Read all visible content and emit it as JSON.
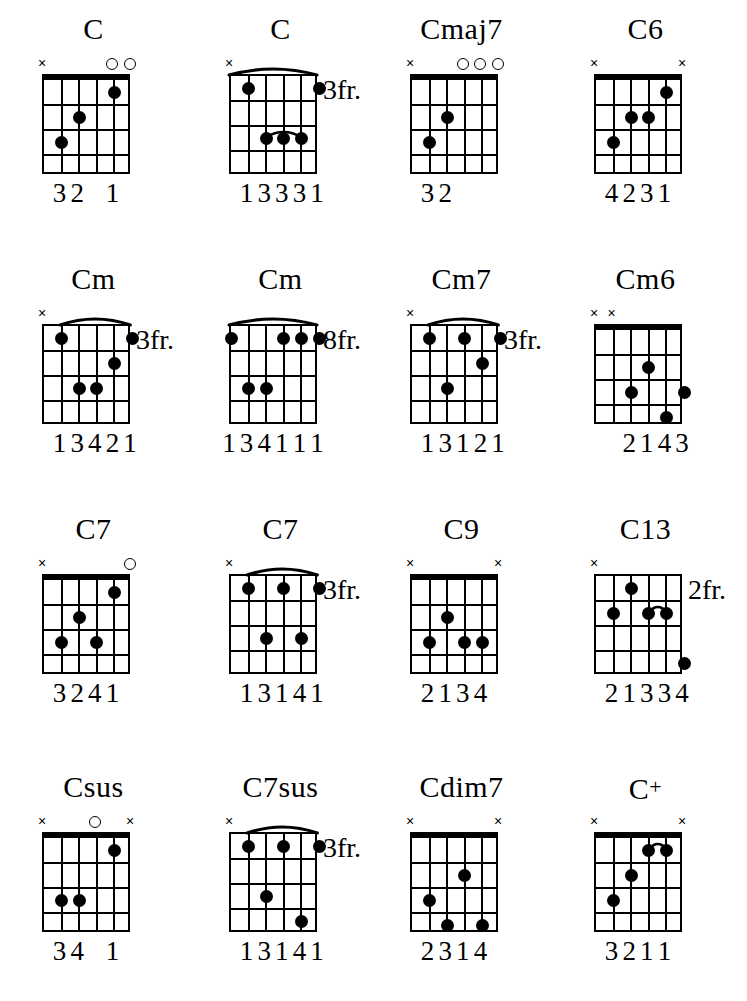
{
  "page": {
    "columns": 4,
    "rows": 4,
    "strings": 6,
    "frets": 4,
    "ink_color": "#000000",
    "background_color": "#ffffff"
  },
  "chart_data": {
    "type": "table",
    "chords": [
      {
        "name": "C",
        "name_suffix": "",
        "position_label": "",
        "barre": null,
        "inner_barre": null,
        "markers": [
          "x",
          "",
          "",
          "",
          "o",
          "o"
        ],
        "dots": [
          {
            "string": 5,
            "fret": 3
          },
          {
            "string": 4,
            "fret": 2
          },
          {
            "string": 2,
            "fret": 1
          }
        ],
        "fingers": [
          "",
          "3",
          "2",
          "",
          "1",
          ""
        ],
        "fingers_text": "32 1"
      },
      {
        "name": "C",
        "name_suffix": "",
        "position_label": "3fr.",
        "barre": {
          "from": 6,
          "to": 1,
          "fret": 1
        },
        "inner_barre": {
          "from": 4,
          "to": 2,
          "fret": 3
        },
        "markers": [
          "x",
          "",
          "",
          "",
          "",
          ""
        ],
        "dots": [
          {
            "string": 5,
            "fret": 1
          },
          {
            "string": 1,
            "fret": 1
          },
          {
            "string": 4,
            "fret": 3
          },
          {
            "string": 3,
            "fret": 3
          },
          {
            "string": 2,
            "fret": 3
          }
        ],
        "fingers": [
          "",
          "1",
          "3",
          "3",
          "3",
          "1"
        ],
        "fingers_text": "13331"
      },
      {
        "name": "Cmaj7",
        "name_suffix": "",
        "position_label": "",
        "barre": null,
        "inner_barre": null,
        "markers": [
          "x",
          "",
          "",
          "o",
          "o",
          "o"
        ],
        "dots": [
          {
            "string": 5,
            "fret": 3
          },
          {
            "string": 4,
            "fret": 2
          }
        ],
        "fingers": [
          "",
          "3",
          "2",
          "",
          "",
          ""
        ],
        "fingers_text": "32"
      },
      {
        "name": "C6",
        "name_suffix": "",
        "position_label": "",
        "barre": null,
        "inner_barre": null,
        "markers": [
          "x",
          "",
          "",
          "",
          "",
          "x"
        ],
        "dots": [
          {
            "string": 5,
            "fret": 3
          },
          {
            "string": 4,
            "fret": 2
          },
          {
            "string": 3,
            "fret": 2
          },
          {
            "string": 2,
            "fret": 1
          }
        ],
        "fingers": [
          "",
          "4",
          "2",
          "3",
          "1",
          ""
        ],
        "fingers_text": "4231"
      },
      {
        "name": "Cm",
        "name_suffix": "",
        "position_label": "3fr.",
        "barre": {
          "from": 5,
          "to": 1,
          "fret": 1
        },
        "inner_barre": null,
        "markers": [
          "x",
          "",
          "",
          "",
          "",
          ""
        ],
        "dots": [
          {
            "string": 5,
            "fret": 1
          },
          {
            "string": 1,
            "fret": 1
          },
          {
            "string": 4,
            "fret": 3
          },
          {
            "string": 3,
            "fret": 3
          },
          {
            "string": 2,
            "fret": 2
          }
        ],
        "fingers": [
          "",
          "1",
          "3",
          "4",
          "2",
          "1"
        ],
        "fingers_text": "13421"
      },
      {
        "name": "Cm",
        "name_suffix": "",
        "position_label": "8fr.",
        "barre": {
          "from": 6,
          "to": 1,
          "fret": 1
        },
        "inner_barre": null,
        "markers": [
          "",
          "",
          "",
          "",
          "",
          ""
        ],
        "dots": [
          {
            "string": 6,
            "fret": 1
          },
          {
            "string": 3,
            "fret": 1
          },
          {
            "string": 2,
            "fret": 1
          },
          {
            "string": 1,
            "fret": 1
          },
          {
            "string": 5,
            "fret": 3
          },
          {
            "string": 4,
            "fret": 3
          }
        ],
        "fingers": [
          "1",
          "3",
          "4",
          "1",
          "1",
          "1"
        ],
        "fingers_text": "134111"
      },
      {
        "name": "Cm7",
        "name_suffix": "",
        "position_label": "3fr.",
        "barre": {
          "from": 5,
          "to": 1,
          "fret": 1
        },
        "inner_barre": null,
        "markers": [
          "x",
          "",
          "",
          "",
          "",
          ""
        ],
        "dots": [
          {
            "string": 5,
            "fret": 1
          },
          {
            "string": 3,
            "fret": 1
          },
          {
            "string": 1,
            "fret": 1
          },
          {
            "string": 4,
            "fret": 3
          },
          {
            "string": 2,
            "fret": 2
          }
        ],
        "fingers": [
          "",
          "1",
          "3",
          "1",
          "2",
          "1"
        ],
        "fingers_text": "13121"
      },
      {
        "name": "Cm6",
        "name_suffix": "",
        "position_label": "",
        "barre": null,
        "inner_barre": null,
        "markers": [
          "x",
          "x",
          "",
          "",
          "",
          ""
        ],
        "dots": [
          {
            "string": 4,
            "fret": 3
          },
          {
            "string": 3,
            "fret": 2
          },
          {
            "string": 2,
            "fret": 4
          },
          {
            "string": 1,
            "fret": 3
          }
        ],
        "fingers": [
          "",
          "",
          "2",
          "1",
          "4",
          "3"
        ],
        "fingers_text": "2 143"
      },
      {
        "name": "C7",
        "name_suffix": "",
        "position_label": "",
        "barre": null,
        "inner_barre": null,
        "markers": [
          "x",
          "",
          "",
          "",
          "",
          "o"
        ],
        "dots": [
          {
            "string": 5,
            "fret": 3
          },
          {
            "string": 4,
            "fret": 2
          },
          {
            "string": 3,
            "fret": 3
          },
          {
            "string": 2,
            "fret": 1
          }
        ],
        "fingers": [
          "",
          "3",
          "2",
          "4",
          "1",
          ""
        ],
        "fingers_text": "3241"
      },
      {
        "name": "C7",
        "name_suffix": "",
        "position_label": "3fr.",
        "barre": {
          "from": 5,
          "to": 1,
          "fret": 1
        },
        "inner_barre": null,
        "markers": [
          "x",
          "",
          "",
          "",
          "",
          ""
        ],
        "dots": [
          {
            "string": 5,
            "fret": 1
          },
          {
            "string": 3,
            "fret": 1
          },
          {
            "string": 1,
            "fret": 1
          },
          {
            "string": 4,
            "fret": 3
          },
          {
            "string": 2,
            "fret": 3
          }
        ],
        "fingers": [
          "",
          "1",
          "3",
          "1",
          "4",
          "1"
        ],
        "fingers_text": "13141"
      },
      {
        "name": "C9",
        "name_suffix": "",
        "position_label": "",
        "barre": null,
        "inner_barre": null,
        "markers": [
          "x",
          "",
          "",
          "",
          "",
          "x"
        ],
        "dots": [
          {
            "string": 5,
            "fret": 3
          },
          {
            "string": 4,
            "fret": 2
          },
          {
            "string": 3,
            "fret": 3
          },
          {
            "string": 2,
            "fret": 3
          }
        ],
        "fingers": [
          "",
          "2",
          "1",
          "3",
          "4",
          ""
        ],
        "fingers_text": "2134"
      },
      {
        "name": "C13",
        "name_suffix": "",
        "position_label": "2fr.",
        "barre": null,
        "inner_barre": {
          "from": 3,
          "to": 2,
          "fret": 2
        },
        "markers": [
          "x",
          "",
          "",
          "",
          "",
          ""
        ],
        "dots": [
          {
            "string": 5,
            "fret": 2
          },
          {
            "string": 4,
            "fret": 1
          },
          {
            "string": 3,
            "fret": 2
          },
          {
            "string": 2,
            "fret": 2
          },
          {
            "string": 1,
            "fret": 4
          }
        ],
        "fingers": [
          "",
          "2",
          "1",
          "3",
          "3",
          "4"
        ],
        "fingers_text": "21334"
      },
      {
        "name": "Csus",
        "name_suffix": "",
        "position_label": "",
        "barre": null,
        "inner_barre": null,
        "markers": [
          "x",
          "",
          "",
          "o",
          "",
          "x"
        ],
        "dots": [
          {
            "string": 5,
            "fret": 3
          },
          {
            "string": 4,
            "fret": 3
          },
          {
            "string": 2,
            "fret": 1
          }
        ],
        "fingers": [
          "",
          "3",
          "4",
          "",
          "1",
          ""
        ],
        "fingers_text": "34 1"
      },
      {
        "name": "C7sus",
        "name_suffix": "",
        "position_label": "3fr.",
        "barre": {
          "from": 5,
          "to": 1,
          "fret": 1
        },
        "inner_barre": null,
        "markers": [
          "x",
          "",
          "",
          "",
          "",
          ""
        ],
        "dots": [
          {
            "string": 5,
            "fret": 1
          },
          {
            "string": 3,
            "fret": 1
          },
          {
            "string": 1,
            "fret": 1
          },
          {
            "string": 4,
            "fret": 3
          },
          {
            "string": 2,
            "fret": 4
          }
        ],
        "fingers": [
          "",
          "1",
          "3",
          "1",
          "4",
          "1"
        ],
        "fingers_text": "13141"
      },
      {
        "name": "Cdim7",
        "name_suffix": "",
        "position_label": "",
        "barre": null,
        "inner_barre": null,
        "markers": [
          "x",
          "",
          "",
          "",
          "",
          "x"
        ],
        "dots": [
          {
            "string": 5,
            "fret": 3
          },
          {
            "string": 4,
            "fret": 4
          },
          {
            "string": 3,
            "fret": 2
          },
          {
            "string": 2,
            "fret": 4
          }
        ],
        "fingers": [
          "",
          "2",
          "3",
          "1",
          "4",
          ""
        ],
        "fingers_text": "2314"
      },
      {
        "name": "C",
        "name_suffix": "+",
        "position_label": "",
        "barre": null,
        "inner_barre": {
          "from": 3,
          "to": 2,
          "fret": 1
        },
        "markers": [
          "x",
          "",
          "",
          "",
          "",
          "x"
        ],
        "dots": [
          {
            "string": 5,
            "fret": 3
          },
          {
            "string": 4,
            "fret": 2
          },
          {
            "string": 3,
            "fret": 1
          },
          {
            "string": 2,
            "fret": 1
          }
        ],
        "fingers": [
          "",
          "3",
          "2",
          "1",
          "1",
          ""
        ],
        "fingers_text": "3211"
      }
    ]
  }
}
